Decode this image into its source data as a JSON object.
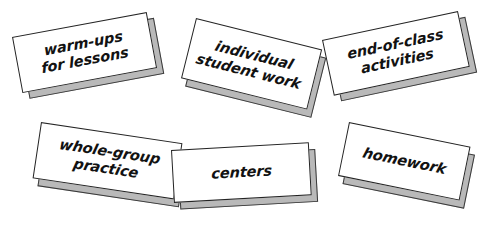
{
  "page": {
    "background_color": "#ffffff",
    "card_face_color": "#ffffff",
    "card_shadow_color": "#b9b9b9",
    "card_outline_color": "#242424",
    "text_color": "#121212"
  },
  "cards": [
    {
      "id": "warm-ups",
      "text": "warm-ups\nfor lessons",
      "lines": [
        "warm-ups",
        "for lessons"
      ],
      "rotation_deg": -10.5
    },
    {
      "id": "individual-student-work",
      "text": "individual\nstudent work",
      "lines": [
        "individual",
        "student work"
      ],
      "rotation_deg": 14
    },
    {
      "id": "end-of-class-activities",
      "text": "end-of-class\nactivities",
      "lines": [
        "end-of-class",
        "activities"
      ],
      "rotation_deg": -12
    },
    {
      "id": "whole-group-practice",
      "text": "whole-group\npractice",
      "lines": [
        "whole-group",
        "practice"
      ],
      "rotation_deg": 8.5
    },
    {
      "id": "centers",
      "text": "centers",
      "lines": [
        "centers"
      ],
      "rotation_deg": -3.2
    },
    {
      "id": "homework",
      "text": "homework",
      "lines": [
        "homework"
      ],
      "rotation_deg": 11.5
    }
  ]
}
